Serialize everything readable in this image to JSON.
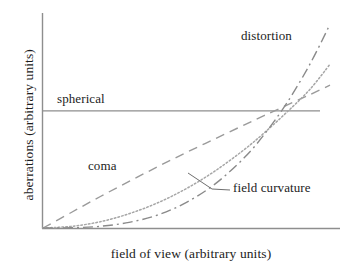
{
  "chart_data": {
    "type": "line",
    "title": "",
    "subtitle": "",
    "xlabel": "field of view (arbitrary units)",
    "ylabel": "aberrations (arbitrary units)",
    "xlim": [
      0,
      1
    ],
    "ylim": [
      0,
      1
    ],
    "grid": false,
    "legend_position": "inline-annotations",
    "axis_ticks": {
      "x": [],
      "y": []
    },
    "series": [
      {
        "name": "spherical",
        "label": "spherical",
        "style": "solid",
        "color": "#8e8e8e",
        "power": 0,
        "x": [
          0.0,
          0.1,
          0.2,
          0.3,
          0.4,
          0.5,
          0.6,
          0.7,
          0.77,
          0.85,
          0.93,
          1.0
        ],
        "y": [
          0.558,
          0.558,
          0.558,
          0.558,
          0.558,
          0.558,
          0.558,
          0.558,
          0.558,
          0.558,
          0.558,
          0.558
        ]
      },
      {
        "name": "coma",
        "label": "coma",
        "style": "dashed",
        "color": "#9a9a9a",
        "power": 1,
        "x": [
          0.0,
          0.1,
          0.2,
          0.3,
          0.4,
          0.5,
          0.6,
          0.7,
          0.77,
          0.85,
          0.93,
          1.0
        ],
        "y": [
          0.0,
          0.075,
          0.15,
          0.222,
          0.292,
          0.36,
          0.425,
          0.49,
          0.535,
          0.585,
          0.635,
          0.68
        ]
      },
      {
        "name": "field curvature",
        "label": "field curvature",
        "style": "dotted",
        "color": "#a6a6a6",
        "power": 2,
        "x": [
          0.0,
          0.1,
          0.2,
          0.3,
          0.4,
          0.5,
          0.6,
          0.7,
          0.77,
          0.85,
          0.93,
          1.0
        ],
        "y": [
          0.0,
          0.008,
          0.03,
          0.068,
          0.12,
          0.188,
          0.272,
          0.372,
          0.452,
          0.552,
          0.66,
          0.78
        ]
      },
      {
        "name": "distortion",
        "label": "distortion",
        "style": "dash-dot",
        "color": "#8a8a8a",
        "power": 3,
        "x": [
          0.0,
          0.1,
          0.2,
          0.3,
          0.4,
          0.5,
          0.6,
          0.7,
          0.77,
          0.85,
          0.93,
          1.0
        ],
        "y": [
          0.0,
          0.001,
          0.008,
          0.027,
          0.062,
          0.122,
          0.21,
          0.333,
          0.444,
          0.596,
          0.78,
          0.97
        ]
      }
    ],
    "annotations": [
      {
        "text": "spherical",
        "x": 0.05,
        "y": 0.6,
        "leader": false
      },
      {
        "text": "coma",
        "x": 0.16,
        "y": 0.33,
        "leader": false
      },
      {
        "text": "distortion",
        "x": 0.67,
        "y": 0.9,
        "leader": false
      },
      {
        "text": "field curvature",
        "x": 0.64,
        "y": 0.24,
        "leader": true
      }
    ]
  },
  "axes": {
    "y_axis_label": "aberrations (arbitrary units)",
    "x_axis_label": "field of view (arbitrary units)",
    "axis_color": "#8e8e8e"
  },
  "labels": {
    "spherical": "spherical",
    "coma": "coma",
    "distortion": "distortion",
    "field_curvature": "field curvature"
  }
}
